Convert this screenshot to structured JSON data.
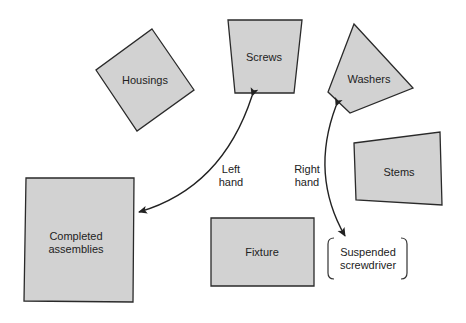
{
  "diagram": {
    "type": "workplace-layout",
    "colors": {
      "bin_fill": "#d2d2d2",
      "outline": "#2a2a2a",
      "text": "#222222",
      "background": "#ffffff"
    },
    "bins": [
      {
        "id": "housings",
        "label": "Housings"
      },
      {
        "id": "screws",
        "label": "Screws"
      },
      {
        "id": "washers",
        "label": "Washers"
      },
      {
        "id": "stems",
        "label": "Stems"
      },
      {
        "id": "completed",
        "label_line1": "Completed",
        "label_line2": "assemblies"
      },
      {
        "id": "fixture",
        "label": "Fixture"
      }
    ],
    "tool": {
      "label_line1": "Suspended",
      "label_line2": "screwdriver"
    },
    "arrows": [
      {
        "id": "left-hand",
        "label_line1": "Left",
        "label_line2": "hand",
        "from": "screws",
        "to": "completed"
      },
      {
        "id": "right-hand",
        "label_line1": "Right",
        "label_line2": "hand",
        "from": "washers",
        "to": "tool"
      }
    ]
  }
}
